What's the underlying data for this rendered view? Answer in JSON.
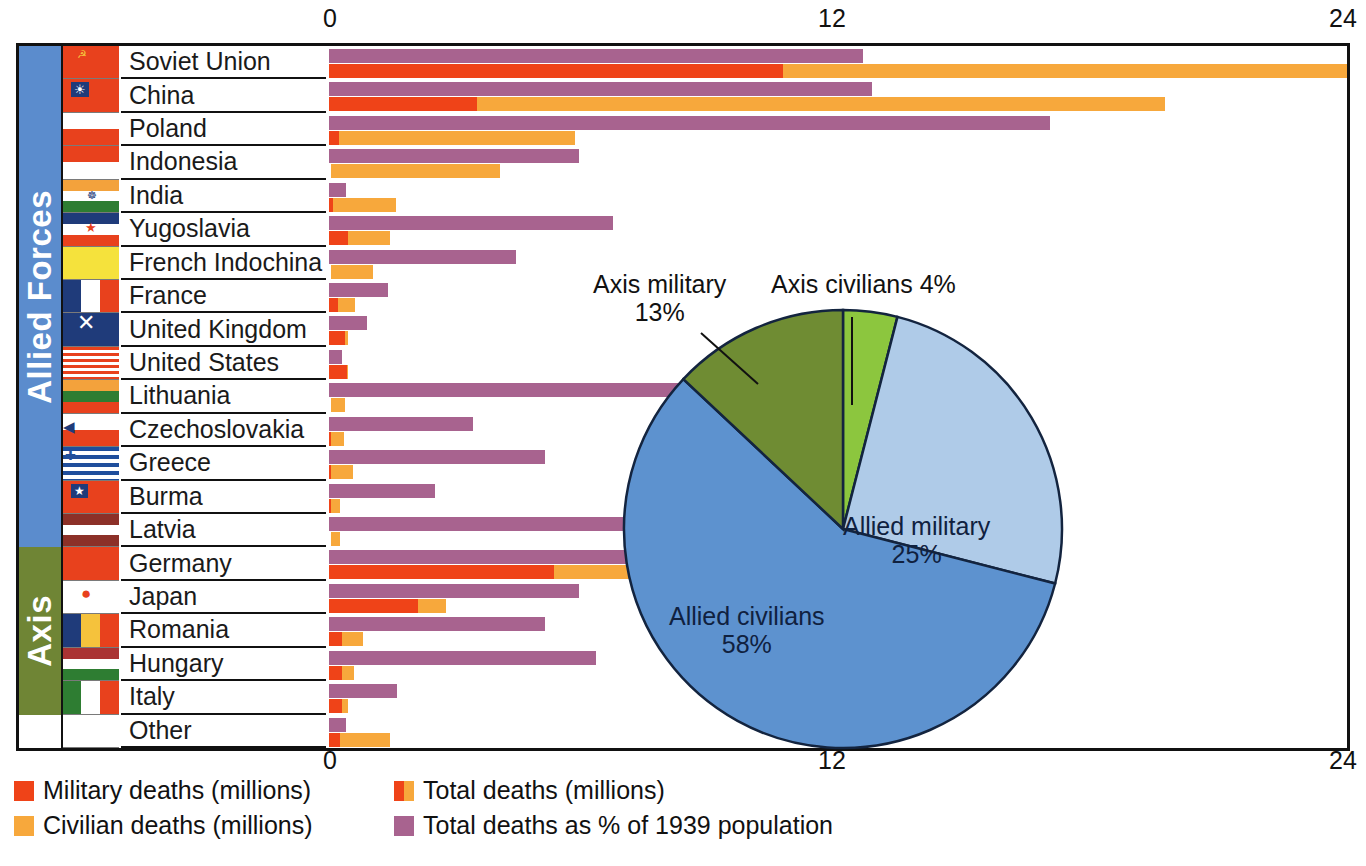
{
  "axis": {
    "ticks_top": [
      "0",
      "12",
      "24"
    ],
    "ticks_bottom": [
      "0",
      "12",
      "24"
    ],
    "min": 0,
    "max": 24,
    "grid_step": 2
  },
  "groups": [
    {
      "name": "Allied Forces",
      "label": "Allied Forces",
      "color": "#5b8ccd",
      "rows": 15
    },
    {
      "name": "Axis",
      "label": "Axis",
      "color": "#6f8535",
      "rows": 5
    }
  ],
  "legend": {
    "items": [
      {
        "label": "Military deaths (millions)",
        "icon": "square-swatch",
        "color": "#ef4318"
      },
      {
        "label": "Total deaths (millions)",
        "icon": "split-square-swatch",
        "color": "#ef4318",
        "color2": "#f7a83c"
      },
      {
        "label": "Civilian deaths (millions)",
        "icon": "square-swatch",
        "color": "#f7a83c"
      },
      {
        "label": "Total deaths  as % of 1939 population",
        "icon": "square-swatch",
        "color": "#a8638f"
      }
    ]
  },
  "chart_data": {
    "type": "bar",
    "title": "",
    "xlabel": "",
    "ylabel": "",
    "xlim": [
      0,
      24
    ],
    "grid": true,
    "orientation": "horizontal",
    "series": [
      {
        "name": "Military deaths (millions)",
        "color": "#ef4318"
      },
      {
        "name": "Civilian deaths (millions)",
        "color": "#f7a83c"
      },
      {
        "name": "Total deaths  as % of 1939 population",
        "color": "#a8638f"
      }
    ],
    "categories": [
      "Soviet Union",
      "China",
      "Poland",
      "Indonesia",
      "India",
      "Yugoslavia",
      "French Indochina",
      "France",
      "United Kingdom",
      "United States",
      "Lithuania",
      "Czechoslovakia",
      "Greece",
      "Burma",
      "Latvia",
      "Germany",
      "Japan",
      "Romania",
      "Hungary",
      "Italy",
      "Other"
    ],
    "rows": [
      {
        "country": "Soviet Union",
        "group": "Allied Forces",
        "flag": "flag-soviet-union",
        "military": 10.7,
        "civilian": 13.3,
        "total": 24.0,
        "pct_of_1939_population": 12.6
      },
      {
        "country": "China",
        "group": "Allied Forces",
        "flag": "flag-china-roc",
        "military": 3.5,
        "civilian": 16.2,
        "total": 19.7,
        "pct_of_1939_population": 12.8
      },
      {
        "country": "Poland",
        "group": "Allied Forces",
        "flag": "flag-poland",
        "military": 0.24,
        "civilian": 5.56,
        "total": 5.8,
        "pct_of_1939_population": 17.0
      },
      {
        "country": "Indonesia",
        "group": "Allied Forces",
        "flag": "flag-indonesia",
        "military": 0.0,
        "civilian": 4.0,
        "total": 4.0,
        "pct_of_1939_population": 5.9
      },
      {
        "country": "India",
        "group": "Allied Forces",
        "flag": "flag-india",
        "military": 0.09,
        "civilian": 1.5,
        "total": 1.6,
        "pct_of_1939_population": 0.4
      },
      {
        "country": "Yugoslavia",
        "group": "Allied Forces",
        "flag": "flag-yugoslavia",
        "military": 0.45,
        "civilian": 1.0,
        "total": 1.45,
        "pct_of_1939_population": 6.7
      },
      {
        "country": "French Indochina",
        "group": "Allied Forces",
        "flag": "flag-french-indochina",
        "military": 0.0,
        "civilian": 1.0,
        "total": 1.0,
        "pct_of_1939_population": 4.4
      },
      {
        "country": "France",
        "group": "Allied Forces",
        "flag": "flag-france",
        "military": 0.21,
        "civilian": 0.4,
        "total": 0.6,
        "pct_of_1939_population": 1.4
      },
      {
        "country": "United Kingdom",
        "group": "Allied Forces",
        "flag": "flag-united-kingdom",
        "military": 0.38,
        "civilian": 0.07,
        "total": 0.45,
        "pct_of_1939_population": 0.9
      },
      {
        "country": "United States",
        "group": "Allied Forces",
        "flag": "flag-united-states",
        "military": 0.42,
        "civilian": 0.02,
        "total": 0.44,
        "pct_of_1939_population": 0.3
      },
      {
        "country": "Lithuania",
        "group": "Allied Forces",
        "flag": "flag-lithuania",
        "military": 0.0,
        "civilian": 0.35,
        "total": 0.35,
        "pct_of_1939_population": 14.4
      },
      {
        "country": "Czechoslovakia",
        "group": "Allied Forces",
        "flag": "flag-czechoslovakia",
        "military": 0.03,
        "civilian": 0.32,
        "total": 0.35,
        "pct_of_1939_population": 3.4
      },
      {
        "country": "Greece",
        "group": "Allied Forces",
        "flag": "flag-greece",
        "military": 0.03,
        "civilian": 0.52,
        "total": 0.55,
        "pct_of_1939_population": 5.1
      },
      {
        "country": "Burma",
        "group": "Allied Forces",
        "flag": "flag-burma",
        "military": 0.03,
        "civilian": 0.22,
        "total": 0.25,
        "pct_of_1939_population": 2.5
      },
      {
        "country": "Latvia",
        "group": "Allied Forces",
        "flag": "flag-latvia",
        "military": 0.0,
        "civilian": 0.23,
        "total": 0.23,
        "pct_of_1939_population": 12.5
      },
      {
        "country": "Germany",
        "group": "Axis",
        "flag": "flag-germany",
        "military": 5.3,
        "civilian": 2.2,
        "total": 7.5,
        "pct_of_1939_population": 10.8
      },
      {
        "country": "Japan",
        "group": "Axis",
        "flag": "flag-japan",
        "military": 2.1,
        "civilian": 0.65,
        "total": 2.75,
        "pct_of_1939_population": 5.9
      },
      {
        "country": "Romania",
        "group": "Axis",
        "flag": "flag-romania",
        "military": 0.3,
        "civilian": 0.5,
        "total": 0.8,
        "pct_of_1939_population": 5.1
      },
      {
        "country": "Hungary",
        "group": "Axis",
        "flag": "flag-hungary",
        "military": 0.3,
        "civilian": 0.3,
        "total": 0.6,
        "pct_of_1939_population": 6.3
      },
      {
        "country": "Italy",
        "group": "Axis",
        "flag": "flag-italy",
        "military": 0.3,
        "civilian": 0.15,
        "total": 0.45,
        "pct_of_1939_population": 1.6
      },
      {
        "country": "Other",
        "group": "",
        "flag": "flag-none",
        "military": 0.25,
        "civilian": 1.2,
        "total": 1.45,
        "pct_of_1939_population": 0.4
      }
    ]
  },
  "pie_chart": {
    "type": "pie",
    "slices": [
      {
        "label": "Allied civilians",
        "value": 58,
        "value_label": "58%",
        "color": "#5d92cf",
        "label_position": "inside"
      },
      {
        "label": "Allied military",
        "value": 25,
        "value_label": "25%",
        "color": "#afcbe8",
        "label_position": "inside"
      },
      {
        "label": "Axis civilians",
        "value": 4,
        "value_label": "4%",
        "color": "#8cc63e",
        "label_position": "outside"
      },
      {
        "label": "Axis military",
        "value": 13,
        "value_label": "13%",
        "color": "#6f8c33",
        "label_position": "outside"
      }
    ]
  }
}
